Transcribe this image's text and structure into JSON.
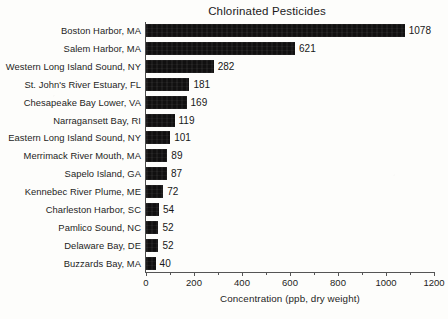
{
  "chart_data": {
    "type": "bar",
    "orientation": "horizontal",
    "title": "Chlorinated Pesticides",
    "xlabel": "Concentration (ppb, dry weight)",
    "ylabel": "",
    "xlim": [
      0,
      1200
    ],
    "xticks": [
      0,
      200,
      400,
      600,
      800,
      1000,
      1200
    ],
    "xtick_labels": [
      "0",
      "200",
      "400",
      "600",
      "800",
      "1000",
      "1200"
    ],
    "minor_tick_interval": 100,
    "grid": false,
    "legend": false,
    "bar_color": "#111010",
    "categories": [
      "Boston Harbor, MA",
      "Salem Harbor, MA",
      "Western Long Island Sound, NY",
      "St. John's River Estuary, FL",
      "Chesapeake Bay Lower, VA",
      "Narragansett Bay, RI",
      "Eastern Long Island Sound, NY",
      "Merrimack River Mouth, MA",
      "Sapelo Island, GA",
      "Kennebec River Plume, ME",
      "Charleston Harbor, SC",
      "Pamlico Sound, NC",
      "Delaware Bay, DE",
      "Buzzards Bay, MA"
    ],
    "values": [
      1078,
      621,
      282,
      181,
      169,
      119,
      101,
      89,
      87,
      72,
      54,
      52,
      52,
      40
    ],
    "value_labels": [
      "1078",
      "621",
      "282",
      "181",
      "169",
      "119",
      "101",
      "89",
      "87",
      "72",
      "54",
      "52",
      "52",
      "40"
    ]
  }
}
